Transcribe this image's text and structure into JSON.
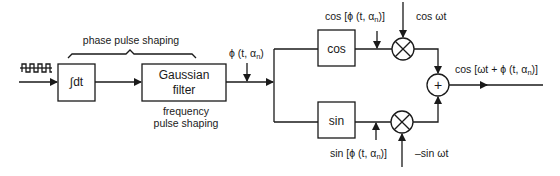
{
  "diagram": {
    "type": "block-diagram",
    "input": {
      "signal_icon": "square-wave-data-icon"
    },
    "blocks": {
      "integrator": {
        "label": "∫dt"
      },
      "gaussian": {
        "line1": "Gaussian",
        "line2": "filter"
      },
      "cos": {
        "label": "cos"
      },
      "sin": {
        "label": "sin"
      },
      "mixer_top": {
        "symbol": "⊗"
      },
      "mixer_bottom": {
        "symbol": "⊗"
      },
      "summer": {
        "symbol": "+"
      }
    },
    "labels": {
      "phase_pulse_shaping": "phase pulse shaping",
      "frequency_line1": "frequency",
      "frequency_line2": "pulse shaping",
      "phi_prefix": "ϕ (t, α",
      "phi_sub": "n",
      "phi_suffix": ")",
      "cos_phi_prefix": "cos [ϕ (t, α",
      "cos_phi_sub": "n",
      "cos_phi_suffix": ")]",
      "sin_phi_prefix": "sin [ϕ (t, α",
      "sin_phi_sub": "n",
      "sin_phi_suffix": ")]",
      "cos_wt": "cos ωt",
      "minus_sin_wt": "–sin ωt",
      "output_prefix": "cos [ωt + ϕ (t, α",
      "output_sub": "n",
      "output_suffix": ")]"
    },
    "colors": {
      "stroke": "#1a1a1a",
      "background": "#ffffff"
    }
  }
}
